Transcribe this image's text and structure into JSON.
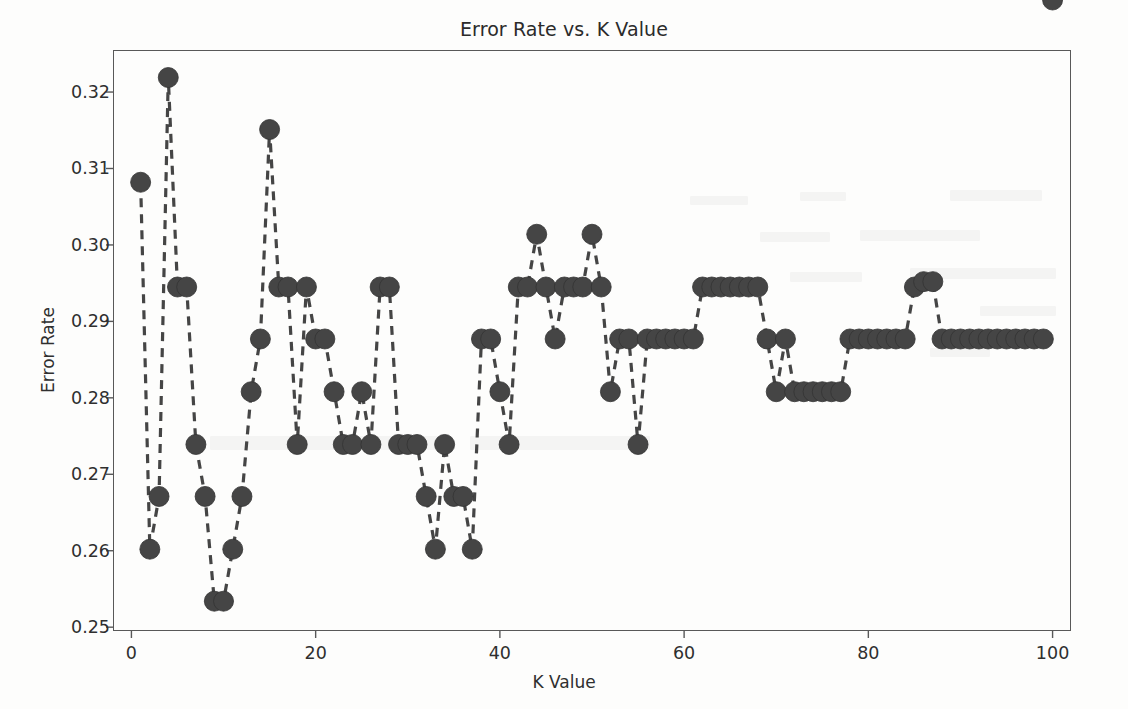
{
  "chart_data": {
    "type": "line",
    "title": "Error Rate vs. K Value",
    "xlabel": "K Value",
    "ylabel": "Error Rate",
    "xlim": [
      -2,
      102
    ],
    "ylim": [
      0.2495,
      0.3255
    ],
    "xticks": [
      0,
      20,
      40,
      60,
      80,
      100
    ],
    "yticks": [
      0.25,
      0.26,
      0.27,
      0.28,
      0.29,
      0.3,
      0.31,
      0.32
    ],
    "ytick_labels": [
      "0.25",
      "0.26",
      "0.27",
      "0.28",
      "0.29",
      "0.30",
      "0.31",
      "0.32"
    ],
    "xtick_labels": [
      "0",
      "20",
      "40",
      "60",
      "80",
      "100"
    ],
    "grid": false,
    "legend": null,
    "marker": "o",
    "markersize": 10,
    "linestyle": "dashed",
    "color": "#454545",
    "marker_color": "#454545",
    "x": [
      1,
      2,
      3,
      4,
      5,
      6,
      7,
      8,
      9,
      10,
      11,
      12,
      13,
      14,
      15,
      16,
      17,
      18,
      19,
      20,
      21,
      22,
      23,
      24,
      25,
      26,
      27,
      28,
      29,
      30,
      31,
      32,
      33,
      34,
      35,
      36,
      37,
      38,
      39,
      40,
      41,
      42,
      43,
      44,
      45,
      46,
      47,
      48,
      49,
      50,
      51,
      52,
      53,
      54,
      55,
      56,
      57,
      58,
      59,
      60,
      61,
      62,
      63,
      64,
      65,
      66,
      67,
      68,
      69,
      70,
      71,
      72,
      73,
      74,
      75,
      76,
      77,
      78,
      79,
      80,
      81,
      82,
      83,
      84,
      85,
      86,
      87,
      88,
      89,
      90,
      91,
      92,
      93,
      94,
      95,
      96,
      97,
      98,
      99,
      100
    ],
    "y": [
      0.3082,
      0.2602,
      0.2671,
      0.3219,
      0.2945,
      0.2945,
      0.2739,
      0.2671,
      0.2534,
      0.2534,
      0.2602,
      0.2671,
      0.2808,
      0.2877,
      0.3151,
      0.2945,
      0.2945,
      0.2739,
      0.2945,
      0.2877,
      0.2877,
      0.2808,
      0.2739,
      0.2739,
      0.2808,
      0.2739,
      0.2945,
      0.2945,
      0.2739,
      0.2739,
      0.2739,
      0.2671,
      0.2602,
      0.2739,
      0.2671,
      0.2671,
      0.2602,
      0.2877,
      0.2877,
      0.2808,
      0.2739,
      0.2945,
      0.2945,
      0.3014,
      0.2945,
      0.2877,
      0.2945,
      0.2945,
      0.2945,
      0.3014,
      0.2945,
      0.2808,
      0.2877,
      0.2877,
      0.2739,
      0.2877,
      0.2877,
      0.2877,
      0.2877,
      0.2877,
      0.2877,
      0.2945,
      0.2945,
      0.2945,
      0.2945,
      0.2945,
      0.2945,
      0.2945,
      0.2877,
      0.2808,
      0.2877,
      0.2808,
      0.2808,
      0.2808,
      0.2808,
      0.2808,
      0.2808,
      0.2877,
      0.2877,
      0.2877,
      0.2877,
      0.2877,
      0.2877,
      0.2877,
      0.2945,
      0.2952,
      0.2952,
      0.2877,
      0.2877,
      0.2877,
      0.2877,
      0.2877,
      0.2877,
      0.2877,
      0.2877,
      0.2877,
      0.2877,
      0.2877,
      0.2877
    ],
    "series_name": "Error Rate"
  }
}
